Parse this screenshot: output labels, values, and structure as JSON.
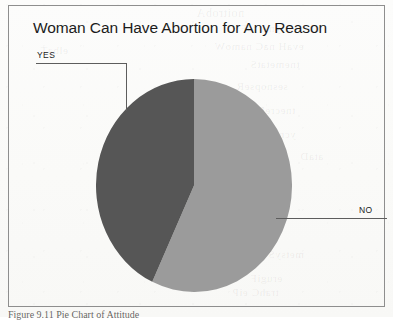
{
  "figure": {
    "title": "Woman Can Have Abortion for Any Reason",
    "caption": "Figure 9.11  Pie Chart of Attitude",
    "frame_color": "#8e8e8e"
  },
  "callouts": {
    "yes": {
      "label": "YES"
    },
    "no": {
      "label": "NO"
    }
  },
  "bleed_through": {
    "line1": "noitrobA",
    "line2": "nosaeR ynA roF",
    "line3": "evaH naC namoW",
    "line4": "tnemetatS",
    "line5": "sesnopseR",
    "line6": "tnecreP",
    "line7": "ycneuqerF",
    "line8": "dilaV",
    "line9": "evitalumuC",
    "line10": "latoT",
    "line11": "gnissiM",
    "line12": "metsyS",
    "line13": "erugiF",
    "line14": "trahC eiP",
    "line15": "elbaT",
    "line16": "ataD"
  },
  "chart_data": {
    "type": "pie",
    "title": "Woman Can Have Abortion for Any Reason",
    "categories": [
      "NO",
      "YES"
    ],
    "values": [
      57,
      43
    ],
    "labels": [
      "NO",
      "YES"
    ],
    "colors": [
      "#9b9b9b",
      "#565656"
    ],
    "legend": "callout-labels",
    "start_angle_deg": 0,
    "direction": "clockwise",
    "series": [
      {
        "name": "Attitude",
        "slices": [
          {
            "label": "NO",
            "value": 57,
            "color": "#9b9b9b",
            "start_deg": 0,
            "end_deg": 205
          },
          {
            "label": "YES",
            "value": 43,
            "color": "#565656",
            "start_deg": 205,
            "end_deg": 360
          }
        ]
      }
    ]
  }
}
